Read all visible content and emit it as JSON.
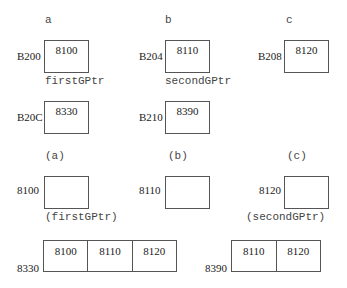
{
  "top_section": {
    "columns": [
      {
        "label": "a",
        "address1": "B200",
        "value1": "8100",
        "pointer_name": "firstGPtr",
        "address2": "B20C",
        "value2": "8330"
      },
      {
        "label": "b",
        "address1": "B204",
        "value1": "8110",
        "pointer_name": "secondGPtr",
        "address2": "B210",
        "value2": "8390"
      },
      {
        "label": "c",
        "address1": "B208",
        "value1": "8120"
      }
    ]
  },
  "bottom_section": {
    "columns": [
      {
        "label": "(a)",
        "address": "8100",
        "caption": "(firstGPtr)"
      },
      {
        "label": "(b)",
        "address": "8110"
      },
      {
        "label": "(c)",
        "address": "8120",
        "caption": "(secondGPtr)"
      }
    ],
    "arrays": [
      {
        "address": "8330",
        "cells": [
          "8100",
          "8110",
          "8120"
        ]
      },
      {
        "address": "8390",
        "cells": [
          "8110",
          "8120"
        ]
      }
    ]
  }
}
